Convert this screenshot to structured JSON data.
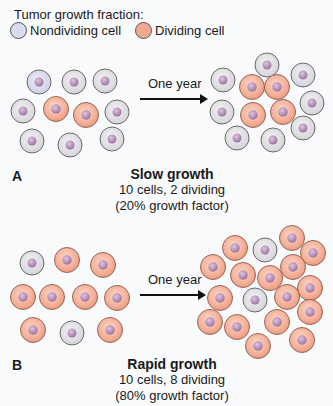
{
  "legend": {
    "title": "Tumor growth fraction:",
    "items": [
      {
        "label": "Nondividing cell",
        "color": "#d9dbef"
      },
      {
        "label": "Dividing cell",
        "color": "#f2a98f"
      }
    ]
  },
  "colors": {
    "nondividing_fill": "#e3e3e6",
    "nondividing_lavender": "#d9d9ee",
    "dividing_fill": "#f3a98f",
    "dividing_inner": "#f8c8b6",
    "nucleus": "#b58bb5",
    "outline": "#5a5a5a"
  },
  "panels": [
    {
      "letter": "A",
      "arrow_label": "One year",
      "caption_title": "Slow growth",
      "caption_line1": "10 cells, 2 dividing",
      "caption_line2": "(20% growth factor)",
      "before": {
        "total": 10,
        "dividing": 2
      },
      "after": {
        "total": 12,
        "dividing": 4
      }
    },
    {
      "letter": "B",
      "arrow_label": "One year",
      "caption_title": "Rapid growth",
      "caption_line1": "10 cells, 8 dividing",
      "caption_line2": "(80% growth factor)",
      "before": {
        "total": 10,
        "dividing": 8
      },
      "after": {
        "total": 20,
        "dividing": 18
      }
    }
  ]
}
